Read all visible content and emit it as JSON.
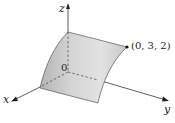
{
  "diagram": {
    "type": "3d-surface-plot",
    "axes": {
      "x_label": "x",
      "y_label": "y",
      "z_label": "z",
      "origin_label": "0"
    },
    "point": {
      "label": "(0, 3, 2)",
      "coordinates": [
        0,
        3,
        2
      ]
    },
    "colors": {
      "surface_light": "#e6e6e6",
      "surface_dark": "#a9a9a9",
      "axis": "#333333",
      "edge": "#555555"
    }
  }
}
